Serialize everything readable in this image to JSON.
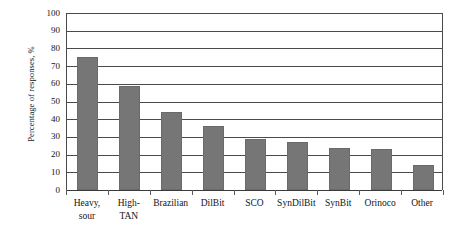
{
  "chart_data": {
    "type": "bar",
    "title": "",
    "subtitle": "",
    "xlabel": "",
    "ylabel": "Percentage of responses, %",
    "ylim": [
      0,
      100
    ],
    "ytick_step": 10,
    "yticks": [
      100,
      90,
      80,
      70,
      60,
      50,
      40,
      30,
      20,
      10,
      0
    ],
    "ytick_labels": [
      "100",
      "90",
      "80",
      "70",
      "60",
      "50",
      "40",
      "30",
      "20",
      "10",
      "0"
    ],
    "grid": true,
    "grid_axis": "y",
    "legend": false,
    "legend_position": "none",
    "bar_color": "#767676",
    "axis_color": "#4a4a4a",
    "categories": [
      "Heavy, sour",
      "High-TAN",
      "Brazilian",
      "DilBit",
      "SCO",
      "SynDilBit",
      "SynBit",
      "Orinoco",
      "Other"
    ],
    "category_lines": [
      [
        "Heavy,",
        "sour"
      ],
      [
        "High-",
        "TAN"
      ],
      [
        "Brazilian",
        ""
      ],
      [
        "DilBit",
        ""
      ],
      [
        "SCO",
        ""
      ],
      [
        "SynDilBit",
        ""
      ],
      [
        "SynBit",
        ""
      ],
      [
        "Orinoco",
        ""
      ],
      [
        "Other",
        ""
      ]
    ],
    "values": [
      75,
      59,
      44,
      36,
      29,
      27,
      24,
      23,
      14
    ]
  }
}
